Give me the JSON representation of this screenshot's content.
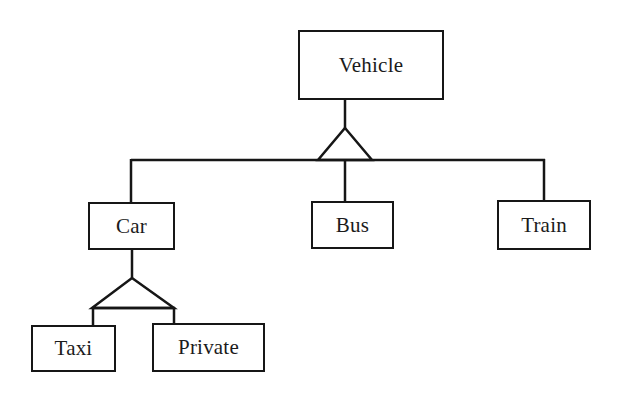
{
  "diagram": {
    "type": "uml-class-inheritance",
    "title": "Vehicle",
    "background_color": "#ffffff",
    "line_color": "#161616",
    "text_color": "#1b1b1b",
    "nodes": [
      {
        "id": "vehicle",
        "label": "Vehicle",
        "x": 298,
        "y": 30,
        "width": 146,
        "height": 70,
        "level": 0
      },
      {
        "id": "car",
        "label": "Car",
        "x": 88,
        "y": 202,
        "width": 87,
        "height": 48,
        "level": 1
      },
      {
        "id": "bus",
        "label": "Bus",
        "x": 311,
        "y": 201,
        "width": 83,
        "height": 48,
        "level": 1
      },
      {
        "id": "train",
        "label": "Train",
        "x": 497,
        "y": 200,
        "width": 94,
        "height": 50,
        "level": 1
      },
      {
        "id": "taxi",
        "label": "Taxi",
        "x": 31,
        "y": 325,
        "width": 85,
        "height": 47,
        "level": 2
      },
      {
        "id": "private",
        "label": "Private",
        "x": 152,
        "y": 323,
        "width": 113,
        "height": 49,
        "level": 2
      }
    ],
    "generalizations": [
      {
        "parent": "vehicle",
        "children": [
          "car",
          "bus",
          "train"
        ]
      },
      {
        "parent": "car",
        "children": [
          "taxi",
          "private"
        ]
      }
    ],
    "triangles": [
      {
        "id": "triangle-vehicle",
        "apex_x": 345,
        "apex_y": 128,
        "base_y": 160,
        "base_left_x": 318,
        "base_right_x": 372
      },
      {
        "id": "triangle-car",
        "apex_x": 132,
        "apex_y": 278,
        "base_y": 308,
        "base_left_x": 92,
        "base_right_x": 174
      }
    ]
  }
}
